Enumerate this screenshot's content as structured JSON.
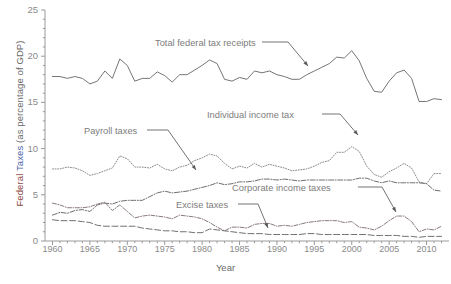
{
  "axis_label": {
    "y_word1": "Federal",
    "y_word2": "Taxes",
    "y_word3": "(as percentage of GDP)",
    "x": "Year"
  },
  "colors": {
    "federal_word": "#8d4a46",
    "taxes_word": "#4a5fa8",
    "line_total": "#6e6e6e",
    "line_individual": "#8a8a8a",
    "line_payroll": "#6e6e6e",
    "line_corporate": "#8a7a7a",
    "line_excise": "#707070",
    "axis": "#9a9a9a",
    "tick_text": "#8a8a8a",
    "annotation_text": "#7d7d7d"
  },
  "annotations": {
    "total": "Total federal tax receipts",
    "individual": "Individual income tax",
    "payroll": "Payroll taxes",
    "corporate": "Corporate income taxes",
    "excise": "Excise taxes"
  },
  "caption_fragment": "",
  "chart_data": {
    "type": "line",
    "title": "",
    "xlabel": "Year",
    "ylabel": "Federal Taxes (as percentage of GDP)",
    "xlim": [
      1959,
      2013
    ],
    "ylim": [
      0,
      25
    ],
    "yticks": [
      0,
      5,
      10,
      15,
      20,
      25
    ],
    "xticks": [
      1960,
      1965,
      1970,
      1975,
      1980,
      1985,
      1990,
      1995,
      2000,
      2005,
      2010
    ],
    "y_minor_tick_step": 1,
    "grid": false,
    "legend": "inline-annotations",
    "x": [
      1960,
      1961,
      1962,
      1963,
      1964,
      1965,
      1966,
      1967,
      1968,
      1969,
      1970,
      1971,
      1972,
      1973,
      1974,
      1975,
      1976,
      1977,
      1978,
      1979,
      1980,
      1981,
      1982,
      1983,
      1984,
      1985,
      1986,
      1987,
      1988,
      1989,
      1990,
      1991,
      1992,
      1993,
      1994,
      1995,
      1996,
      1997,
      1998,
      1999,
      2000,
      2001,
      2002,
      2003,
      2004,
      2005,
      2006,
      2007,
      2008,
      2009,
      2010,
      2011,
      2012
    ],
    "series": [
      {
        "name": "Total federal tax receipts",
        "style": "solid",
        "color": "#6e6e6e",
        "values": [
          17.8,
          17.8,
          17.6,
          17.8,
          17.6,
          17.0,
          17.3,
          18.4,
          17.6,
          19.7,
          19.0,
          17.3,
          17.6,
          17.6,
          18.3,
          17.9,
          17.2,
          18.0,
          18.0,
          18.5,
          19.0,
          19.6,
          19.2,
          17.5,
          17.3,
          17.7,
          17.5,
          18.4,
          18.2,
          18.4,
          18.0,
          17.8,
          17.5,
          17.5,
          18.0,
          18.4,
          18.8,
          19.2,
          19.9,
          19.8,
          20.6,
          19.5,
          17.6,
          16.2,
          16.1,
          17.3,
          18.2,
          18.5,
          17.6,
          15.1,
          15.1,
          15.4,
          15.3
        ]
      },
      {
        "name": "Individual income tax",
        "style": "dotted",
        "color": "#8a8a8a",
        "values": [
          7.8,
          7.8,
          8.0,
          7.9,
          7.6,
          7.1,
          7.3,
          7.6,
          7.9,
          9.2,
          8.9,
          8.0,
          8.0,
          7.9,
          8.3,
          7.8,
          7.6,
          8.0,
          8.2,
          8.7,
          9.0,
          9.4,
          9.2,
          8.4,
          7.8,
          8.1,
          7.9,
          8.4,
          8.0,
          8.3,
          8.1,
          7.9,
          7.6,
          7.7,
          7.8,
          8.1,
          8.5,
          8.7,
          9.6,
          9.6,
          10.2,
          9.7,
          8.1,
          7.2,
          6.9,
          7.5,
          7.9,
          8.4,
          7.9,
          6.4,
          6.2,
          7.3,
          7.3
        ]
      },
      {
        "name": "Payroll taxes",
        "style": "dashdot",
        "color": "#6e6e6e",
        "values": [
          2.8,
          3.1,
          3.0,
          3.3,
          3.4,
          3.2,
          3.9,
          4.1,
          4.0,
          4.3,
          4.4,
          4.4,
          4.4,
          4.8,
          5.2,
          5.4,
          5.2,
          5.3,
          5.4,
          5.6,
          5.8,
          6.0,
          6.3,
          6.1,
          6.2,
          6.4,
          6.4,
          6.5,
          6.7,
          6.7,
          6.6,
          6.7,
          6.6,
          6.5,
          6.6,
          6.6,
          6.6,
          6.6,
          6.6,
          6.6,
          6.6,
          6.8,
          6.8,
          6.5,
          6.3,
          6.5,
          6.3,
          6.3,
          6.3,
          6.3,
          6.2,
          5.5,
          5.4
        ]
      },
      {
        "name": "Corporate income taxes",
        "style": "dashdot-thin",
        "color": "#8a7a7a",
        "values": [
          4.1,
          3.9,
          3.6,
          3.6,
          3.6,
          3.7,
          4.0,
          4.2,
          3.3,
          3.9,
          3.2,
          2.5,
          2.7,
          2.8,
          2.7,
          2.6,
          2.4,
          2.8,
          2.7,
          2.6,
          2.4,
          2.0,
          1.5,
          1.1,
          1.5,
          1.5,
          1.4,
          1.8,
          1.9,
          1.9,
          1.6,
          1.7,
          1.6,
          1.8,
          2.0,
          2.1,
          2.2,
          2.2,
          2.2,
          2.0,
          2.1,
          1.5,
          1.4,
          1.2,
          1.6,
          2.2,
          2.7,
          2.7,
          2.1,
          1.0,
          1.3,
          1.2,
          1.6
        ]
      },
      {
        "name": "Excise taxes",
        "style": "longdash",
        "color": "#707070",
        "values": [
          2.3,
          2.2,
          2.2,
          2.2,
          2.1,
          2.0,
          1.7,
          1.6,
          1.6,
          1.6,
          1.6,
          1.6,
          1.4,
          1.3,
          1.2,
          1.1,
          1.1,
          1.0,
          1.0,
          0.9,
          0.9,
          1.3,
          1.2,
          1.1,
          1.0,
          0.9,
          0.8,
          0.8,
          0.8,
          0.7,
          0.7,
          0.7,
          0.7,
          0.7,
          0.8,
          0.8,
          0.7,
          0.7,
          0.7,
          0.7,
          0.7,
          0.7,
          0.7,
          0.6,
          0.6,
          0.6,
          0.6,
          0.5,
          0.5,
          0.4,
          0.5,
          0.5,
          0.5
        ]
      }
    ]
  }
}
